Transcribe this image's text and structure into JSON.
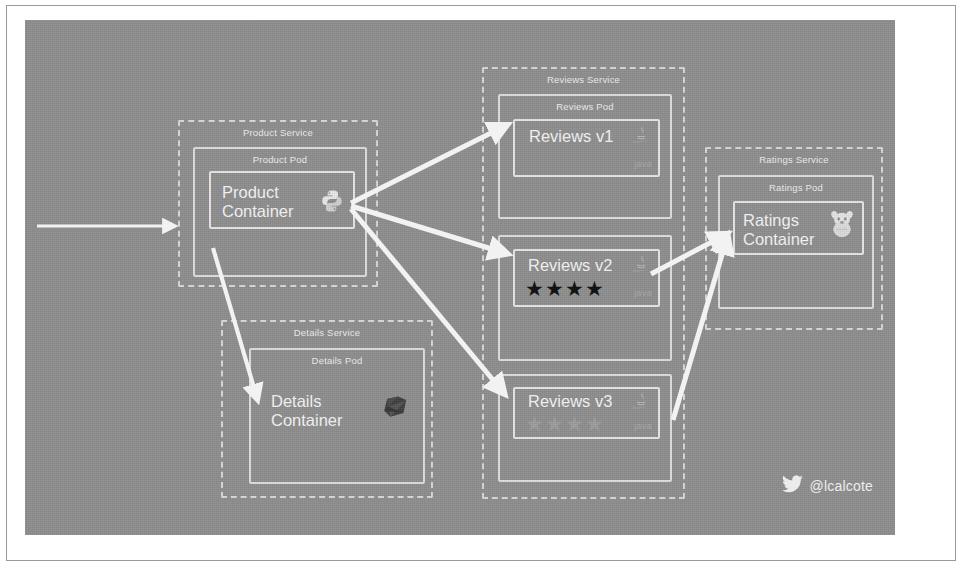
{
  "diagram": {
    "canvas_color": "#8e8e8e",
    "line_color": "#dedede",
    "arrow_color": "#f2f2f2"
  },
  "services": [
    {
      "id": "product",
      "service_label": "Product Service",
      "pods": [
        {
          "pod_label": "Product Pod",
          "container_title": "Product\nContainer",
          "language": "python",
          "language_word": "",
          "stars": null
        }
      ]
    },
    {
      "id": "details",
      "service_label": "Details Service",
      "pods": [
        {
          "pod_label": "Details Pod",
          "container_title": "Details\nContainer",
          "language": "ruby",
          "language_word": "",
          "stars": null
        }
      ]
    },
    {
      "id": "reviews",
      "service_label": "Reviews Service",
      "pods": [
        {
          "pod_label": "Reviews Pod",
          "container_title": "Reviews v1",
          "language": "java",
          "language_word": "java",
          "stars": null
        },
        {
          "pod_label": "",
          "container_title": "Reviews v2",
          "language": "java",
          "language_word": "java",
          "stars": {
            "count": 4,
            "style": "filled",
            "glyph": "★"
          }
        },
        {
          "pod_label": "",
          "container_title": "Reviews v3",
          "language": "java",
          "language_word": "java",
          "stars": {
            "count": 4,
            "style": "ghost",
            "glyph": "★"
          }
        }
      ]
    },
    {
      "id": "ratings",
      "service_label": "Ratings Service",
      "pods": [
        {
          "pod_label": "Ratings Pod",
          "container_title": "Ratings\nContainer",
          "language": "nodejs",
          "language_word": "",
          "stars": null
        }
      ]
    }
  ],
  "flows": [
    {
      "from": "ingress",
      "to": "product",
      "label": ""
    },
    {
      "from": "product",
      "to": "details",
      "label": ""
    },
    {
      "from": "product",
      "to": "reviews-v1",
      "label": ""
    },
    {
      "from": "product",
      "to": "reviews-v2",
      "label": ""
    },
    {
      "from": "product",
      "to": "reviews-v3",
      "label": ""
    },
    {
      "from": "reviews-v2",
      "to": "ratings",
      "label": ""
    },
    {
      "from": "reviews-v3",
      "to": "ratings",
      "label": ""
    }
  ],
  "attribution": {
    "icon": "twitter-bird-icon",
    "handle": "@lcalcote"
  }
}
